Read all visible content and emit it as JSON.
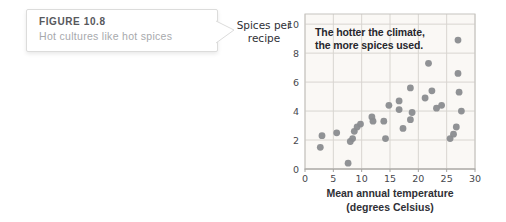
{
  "figure_callout": {
    "label": "FIGURE 10.8",
    "caption": "Hot cultures like hot spices"
  },
  "chart_data": {
    "type": "scatter",
    "annotation": {
      "line1": "The hotter the climate,",
      "line2": "the more spices used."
    },
    "ylabel_line1": "Spices per",
    "ylabel_line2": "recipe",
    "xlabel_line1": "Mean annual temperature",
    "xlabel_line2": "(degrees Celsius)",
    "x_ticks": [
      0,
      5,
      10,
      15,
      20,
      25,
      30
    ],
    "y_ticks": [
      0,
      2,
      4,
      6,
      8,
      10
    ],
    "xlim": [
      0,
      30
    ],
    "ylim": [
      0,
      10.7
    ],
    "grid": true,
    "legend": "none",
    "points": [
      [
        2.7,
        1.5
      ],
      [
        3.0,
        2.3
      ],
      [
        5.6,
        2.5
      ],
      [
        7.6,
        0.4
      ],
      [
        8.0,
        1.9
      ],
      [
        8.4,
        2.1
      ],
      [
        8.7,
        2.6
      ],
      [
        9.2,
        2.9
      ],
      [
        9.8,
        3.1
      ],
      [
        11.8,
        3.6
      ],
      [
        12.0,
        3.3
      ],
      [
        13.9,
        3.3
      ],
      [
        14.2,
        2.1
      ],
      [
        14.8,
        4.4
      ],
      [
        16.6,
        4.7
      ],
      [
        16.6,
        4.1
      ],
      [
        17.3,
        2.8
      ],
      [
        18.6,
        3.4
      ],
      [
        18.9,
        3.9
      ],
      [
        18.6,
        5.6
      ],
      [
        21.2,
        4.9
      ],
      [
        21.8,
        7.3
      ],
      [
        22.4,
        5.4
      ],
      [
        23.2,
        4.2
      ],
      [
        24.1,
        4.4
      ],
      [
        25.6,
        2.1
      ],
      [
        26.2,
        2.4
      ],
      [
        26.7,
        2.9
      ],
      [
        27.0,
        8.9
      ],
      [
        27.0,
        6.6
      ],
      [
        27.2,
        5.3
      ],
      [
        27.6,
        4.0
      ]
    ],
    "colors": {
      "dot": "#8a8c8f",
      "grid": "#d8d5d0",
      "frame": "#c6c4c0",
      "axis": "#a5a3a0",
      "plot_bg": "#faf8f5",
      "text": "#2f3036",
      "tick_text": "#47484d"
    }
  }
}
